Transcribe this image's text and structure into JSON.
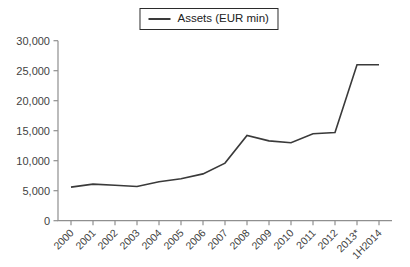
{
  "legend": {
    "label": "Assets (EUR min)"
  },
  "chart_data": {
    "type": "line",
    "title": "",
    "xlabel": "",
    "ylabel": "",
    "categories": [
      "2000",
      "2001",
      "2002",
      "2003",
      "2004",
      "2005",
      "2006",
      "2007",
      "2008",
      "2009",
      "2010",
      "2011",
      "2012",
      "2013*",
      "1H2014"
    ],
    "series": [
      {
        "name": "Assets (EUR min)",
        "values": [
          5600,
          6100,
          5900,
          5700,
          6500,
          7000,
          7800,
          9600,
          14200,
          13300,
          13000,
          14500,
          14700,
          26000,
          26000
        ]
      }
    ],
    "ylim": [
      0,
      30000
    ],
    "ytick_step": 5000,
    "ytick_values": [
      0,
      5000,
      10000,
      15000,
      20000,
      25000,
      30000
    ],
    "ytick_labels": [
      "0",
      "5,000",
      "10,000",
      "15,000",
      "20,000",
      "25,000",
      "30,000"
    ],
    "grid": false,
    "legend_position": "top-center",
    "x_label_rotation_deg": 45,
    "colors": {
      "line": "#3a3a3a",
      "axis": "#8f8f8f",
      "tick": "#8f8f8f",
      "label": "#3f3f3f",
      "background": "#ffffff",
      "legend_border": "#2b2b2b"
    }
  }
}
